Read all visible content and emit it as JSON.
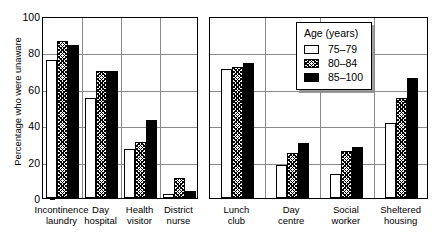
{
  "chart_data": {
    "type": "bar",
    "title": "",
    "xlabel": "",
    "ylabel": "Percentage who were unaware",
    "ylim": [
      0,
      100
    ],
    "yticks": [
      0,
      20,
      40,
      60,
      80,
      100
    ],
    "grid": true,
    "legend_position": "top-right",
    "legend_title": "Age (years)",
    "categories": [
      "Incontinence laundry",
      "Day hospital",
      "Health visitor",
      "District nurse",
      "Lunch club",
      "Day centre",
      "Social worker",
      "Sheltered housing"
    ],
    "category_lines": [
      [
        "Incontinence",
        "laundry"
      ],
      [
        "Day",
        "hospital"
      ],
      [
        "Health",
        "visitor"
      ],
      [
        "District",
        "nurse"
      ],
      [
        "Lunch",
        "club"
      ],
      [
        "Day",
        "centre"
      ],
      [
        "Social",
        "worker"
      ],
      [
        "Sheltered",
        "housing"
      ]
    ],
    "series": [
      {
        "name": "75–79",
        "fill": "white",
        "values": [
          76,
          55,
          27,
          2,
          71,
          18,
          13,
          41
        ]
      },
      {
        "name": "80–84",
        "fill": "hatch",
        "values": [
          86,
          70,
          31,
          11,
          72,
          25,
          26,
          55
        ]
      },
      {
        "name": "85–100",
        "fill": "black",
        "values": [
          84,
          70,
          43,
          4,
          74,
          30,
          28,
          66
        ]
      }
    ],
    "panels": [
      {
        "categories": [
          0,
          1,
          2,
          3
        ]
      },
      {
        "categories": [
          4,
          5,
          6,
          7
        ]
      }
    ]
  },
  "colors": {
    "axis": "#000000",
    "grid": "#8a8a8a",
    "series_white": "#ffffff",
    "series_black": "#000000",
    "background": "#ffffff"
  }
}
